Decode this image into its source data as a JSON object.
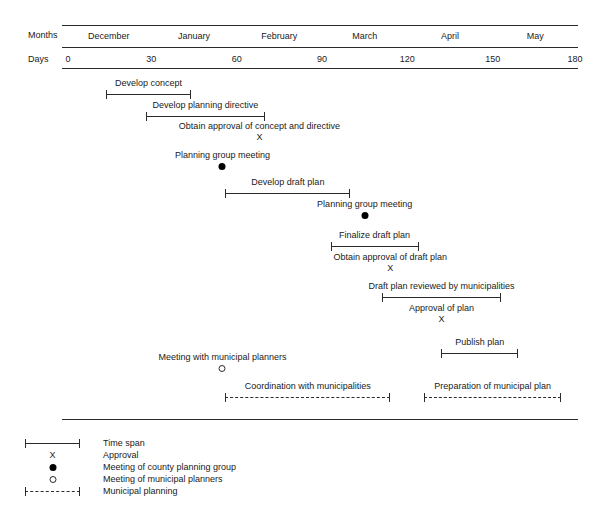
{
  "chart_data": {
    "type": "bar",
    "title": "",
    "subtitle": "",
    "xlabel": "Days",
    "ylabel": "",
    "xlim": [
      0,
      180
    ],
    "grid": false,
    "legend_position": "bottom-left",
    "axis": {
      "months_label": "Months",
      "days_label": "Days",
      "months": [
        "December",
        "January",
        "February",
        "March",
        "April",
        "May"
      ],
      "month_centers_days": [
        15,
        45,
        75,
        105,
        135,
        165
      ],
      "day_ticks": [
        "0",
        "30",
        "60",
        "90",
        "120",
        "150",
        "180"
      ],
      "day_tick_values": [
        0,
        30,
        60,
        90,
        120,
        150,
        180
      ]
    },
    "tasks": [
      {
        "label": "Develop concept",
        "kind": "span",
        "start": 14,
        "end": 44,
        "row": 0
      },
      {
        "label": "Develop planning directive",
        "kind": "span",
        "start": 28,
        "end": 70,
        "row": 1
      },
      {
        "label": "Obtain approval of concept and directive",
        "kind": "approval",
        "at": 68,
        "row": 2
      },
      {
        "label": "Planning group meeting",
        "kind": "county-meeting",
        "at": 55,
        "row": 3
      },
      {
        "label": "Develop draft plan",
        "kind": "span",
        "start": 56,
        "end": 100,
        "row": 4
      },
      {
        "label": "Planning group meeting",
        "kind": "county-meeting",
        "at": 105,
        "row": 5
      },
      {
        "label": "Finalize draft plan",
        "kind": "span",
        "start": 93,
        "end": 124,
        "row": 6
      },
      {
        "label": "Obtain approval of draft plan",
        "kind": "approval",
        "at": 114,
        "row": 7
      },
      {
        "label": "Draft plan reviewed by municipalities",
        "kind": "span",
        "start": 111,
        "end": 153,
        "row": 8
      },
      {
        "label": "Approval of plan",
        "kind": "approval",
        "at": 132,
        "row": 9
      },
      {
        "label": "Publish plan",
        "kind": "span",
        "start": 132,
        "end": 159,
        "row": 10
      },
      {
        "label": "Meeting with municipal planners",
        "kind": "municipal-meeting",
        "at": 55,
        "row": 11
      },
      {
        "label": "Coordination with municipalities",
        "kind": "municipal",
        "start": 56,
        "end": 114,
        "row": 12
      },
      {
        "label": "Preparation of municipal plan",
        "kind": "municipal",
        "start": 126,
        "end": 174,
        "row": 12
      }
    ],
    "legend": [
      {
        "symbol": "time-span",
        "label": "Time span"
      },
      {
        "symbol": "approval-x",
        "label": "Approval"
      },
      {
        "symbol": "filled-circle",
        "label": "Meeting of county planning group"
      },
      {
        "symbol": "open-circle",
        "label": "Meeting of municipal planners"
      },
      {
        "symbol": "dashed-time-span",
        "label": "Municipal planning"
      }
    ],
    "approval_marker_glyph": "X",
    "colors": {
      "ink": "#1a1a1a",
      "rule": "#2b2b2b",
      "background": "#ffffff"
    }
  }
}
